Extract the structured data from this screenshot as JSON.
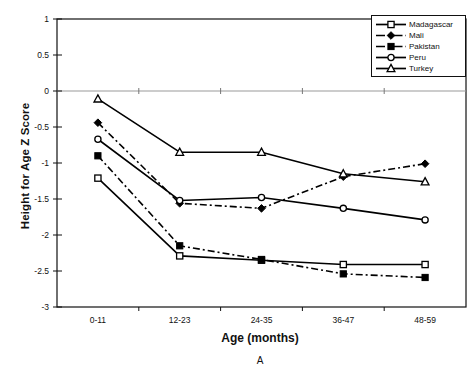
{
  "chart_data": {
    "type": "line",
    "title": "",
    "panel_label": "A",
    "xlabel": "Age (months)",
    "ylabel": "Height for Age Z Score",
    "categories": [
      "0-11",
      "12-23",
      "24-35",
      "36-47",
      "48-59"
    ],
    "ylim": [
      -3,
      1
    ],
    "yticks": [
      "1",
      "0.5",
      "0",
      "-0.5",
      "-1",
      "-1.5",
      "-2",
      "-2.5",
      "-3"
    ],
    "ytick_values": [
      1,
      0.5,
      0,
      -0.5,
      -1,
      -1.5,
      -2,
      -2.5,
      -3
    ],
    "grid": false,
    "zero_line": true,
    "legend_position": "top-right",
    "series": [
      {
        "name": "Madagascar",
        "marker": "open-square",
        "line": "solid",
        "color": "#000000",
        "values": [
          -1.21,
          -2.29,
          -2.35,
          -2.41,
          -2.41
        ]
      },
      {
        "name": "Mali",
        "marker": "filled-diamond",
        "line": "dash-dot",
        "color": "#000000",
        "values": [
          -0.44,
          -1.56,
          -1.63,
          -1.19,
          -1.01
        ]
      },
      {
        "name": "Pakistan",
        "marker": "filled-square",
        "line": "dash-dot",
        "color": "#000000",
        "values": [
          -0.9,
          -2.15,
          -2.34,
          -2.54,
          -2.59
        ]
      },
      {
        "name": "Peru",
        "marker": "open-circle",
        "line": "solid",
        "color": "#000000",
        "values": [
          -0.67,
          -1.52,
          -1.48,
          -1.63,
          -1.79
        ]
      },
      {
        "name": "Turkey",
        "marker": "open-triangle",
        "line": "solid",
        "color": "#000000",
        "values": [
          -0.11,
          -0.85,
          -0.85,
          -1.15,
          -1.26
        ]
      }
    ]
  },
  "axes": {
    "plot_border_color": "#111111",
    "zero_line_color": "#999999"
  }
}
